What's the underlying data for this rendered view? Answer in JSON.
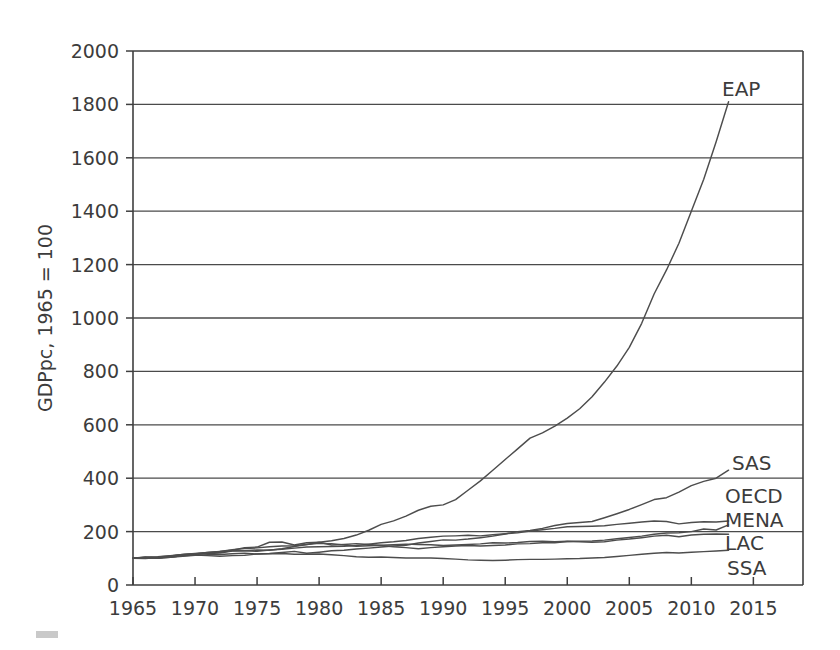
{
  "chart_data": {
    "type": "line",
    "title": "",
    "xlabel": "",
    "ylabel": "GDPpc, 1965 = 100",
    "xlim": [
      1965,
      2019
    ],
    "ylim": [
      0,
      2000
    ],
    "grid": true,
    "legend_position": "right-inline-labels",
    "yticks": [
      0,
      200,
      400,
      600,
      800,
      1000,
      1200,
      1400,
      1600,
      1800,
      2000
    ],
    "ytick_labels": [
      "0",
      "200",
      "400",
      "600",
      "800",
      "1000",
      "1200",
      "1400",
      "1600",
      "1800",
      "2000"
    ],
    "xticks": [
      1965,
      1970,
      1975,
      1980,
      1985,
      1990,
      1995,
      2000,
      2005,
      2010,
      2015
    ],
    "xtick_labels": [
      "1965",
      "1970",
      "1975",
      "1980",
      "1985",
      "1990",
      "1995",
      "2000",
      "2005",
      "2010",
      "2015"
    ],
    "x": [
      1965,
      1966,
      1967,
      1968,
      1969,
      1970,
      1971,
      1972,
      1973,
      1974,
      1975,
      1976,
      1977,
      1978,
      1979,
      1980,
      1981,
      1982,
      1983,
      1984,
      1985,
      1986,
      1987,
      1988,
      1989,
      1990,
      1991,
      1992,
      1993,
      1994,
      1995,
      1996,
      1997,
      1998,
      1999,
      2000,
      2001,
      2002,
      2003,
      2004,
      2005,
      2006,
      2007,
      2008,
      2009,
      2010,
      2011,
      2012,
      2013
    ],
    "series": [
      {
        "name": "EAP",
        "label": "EAP",
        "color": "#4d4d4d",
        "label_value": 1810,
        "values": [
          100,
          102,
          100,
          104,
          110,
          114,
          118,
          120,
          127,
          128,
          131,
          130,
          136,
          144,
          152,
          160,
          166,
          174,
          187,
          205,
          227,
          240,
          258,
          280,
          295,
          300,
          320,
          355,
          390,
          430,
          470,
          510,
          550,
          570,
          595,
          625,
          660,
          705,
          760,
          820,
          890,
          980,
          1090,
          1180,
          1280,
          1400,
          1520,
          1660,
          1810
        ]
      },
      {
        "name": "SAS",
        "label": "SAS",
        "color": "#4d4d4d",
        "label_value": 430,
        "values": [
          100,
          99,
          103,
          105,
          109,
          112,
          110,
          108,
          110,
          111,
          116,
          118,
          122,
          126,
          119,
          123,
          128,
          130,
          135,
          138,
          142,
          146,
          149,
          157,
          163,
          169,
          168,
          172,
          177,
          183,
          191,
          200,
          204,
          212,
          223,
          230,
          234,
          238,
          252,
          267,
          283,
          301,
          320,
          327,
          348,
          372,
          388,
          400,
          430
        ]
      },
      {
        "name": "OECD",
        "label": "OECD",
        "color": "#4d4d4d",
        "label_value": 240,
        "values": [
          100,
          104,
          106,
          110,
          114,
          117,
          119,
          123,
          128,
          128,
          126,
          131,
          134,
          138,
          142,
          143,
          144,
          145,
          148,
          153,
          158,
          162,
          167,
          174,
          179,
          183,
          184,
          186,
          184,
          188,
          192,
          196,
          202,
          207,
          212,
          218,
          219,
          220,
          222,
          227,
          231,
          236,
          240,
          238,
          229,
          234,
          237,
          236,
          240
        ]
      },
      {
        "name": "MENA",
        "label": "MENA",
        "color": "#4d4d4d",
        "label_value": 225,
        "values": [
          100,
          105,
          100,
          108,
          113,
          116,
          122,
          126,
          130,
          140,
          142,
          160,
          161,
          150,
          158,
          160,
          150,
          152,
          155,
          152,
          148,
          143,
          140,
          136,
          140,
          143,
          146,
          148,
          146,
          148,
          150,
          154,
          155,
          158,
          158,
          163,
          164,
          165,
          168,
          173,
          178,
          183,
          190,
          195,
          196,
          200,
          210,
          206,
          225
        ]
      },
      {
        "name": "LAC",
        "label": "LAC",
        "color": "#4d4d4d",
        "label_value": 190,
        "values": [
          100,
          103,
          105,
          109,
          114,
          118,
          122,
          126,
          132,
          137,
          139,
          143,
          146,
          147,
          152,
          156,
          155,
          150,
          145,
          147,
          149,
          151,
          153,
          152,
          151,
          148,
          150,
          152,
          154,
          158,
          157,
          159,
          163,
          164,
          162,
          164,
          162,
          160,
          162,
          168,
          172,
          177,
          183,
          186,
          181,
          187,
          190,
          191,
          190
        ]
      },
      {
        "name": "SSA",
        "label": "SSA",
        "color": "#4d4d4d",
        "label_value": 130,
        "values": [
          100,
          102,
          101,
          104,
          108,
          111,
          113,
          114,
          117,
          119,
          116,
          117,
          118,
          115,
          115,
          116,
          113,
          110,
          106,
          104,
          105,
          103,
          101,
          101,
          101,
          99,
          97,
          94,
          93,
          92,
          93,
          95,
          96,
          96,
          97,
          98,
          99,
          101,
          103,
          107,
          111,
          115,
          119,
          122,
          120,
          123,
          125,
          127,
          130
        ]
      }
    ]
  },
  "figure": {
    "y_axis_title": "GDPpc, 1965 = 100"
  }
}
